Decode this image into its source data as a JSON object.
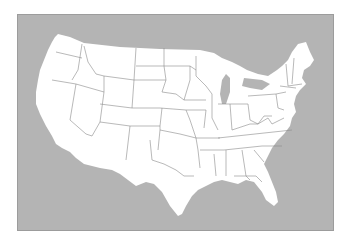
{
  "map": {
    "subject": "Contiguous United States blank outline map",
    "colors": {
      "page": "#ffffff",
      "water": "#b4b4b4",
      "land": "#ffffff",
      "state_border": "#8a8a8a"
    },
    "land_outline": "M55,37 L58,34 L70,37 L84,43 L120,47 L160,49 L200,50 L214,53 L222,58 L232,62 L240,66 L247,70 L258,74 L268,76 L277,70 L282,66 L288,60 L292,52 L298,44 L306,42 L310,52 L314,60 L310,66 L304,70 L302,78 L306,84 L300,90 L296,96 L294,104 L296,112 L292,118 L290,126 L284,134 L278,140 L272,148 L268,156 L264,164 L268,172 L272,182 L276,192 L278,202 L274,206 L266,200 L262,192 L254,182 L246,180 L238,184 L230,182 L222,180 L214,182 L206,186 L198,190 L192,196 L186,206 L182,214 L178,216 L170,206 L162,192 L154,184 L146,182 L136,186 L128,180 L120,174 L112,170 L100,168 L84,164 L76,158 L70,152 L62,148 L56,144 L52,136 L46,126 L40,114 L36,104 L36,92 L38,80 L40,70 L44,60 L48,50 L52,42 Z",
    "lake_michigan": "M222,80 L226,74 L230,78 L230,92 L226,104 L222,104 L220,94 Z",
    "lake_erie_ontario": "M244,78 L262,80 L270,84 L262,90 L250,88 L242,86 Z",
    "state_borders": [
      "M56,52 L82,58",
      "M82,44 L78,70 L72,80",
      "M52,80 L76,84 L104,92",
      "M76,84 L70,120 L86,134 L92,136",
      "M104,92 L100,122 L92,136",
      "M100,104 L132,108",
      "M100,122 L130,126 L126,160",
      "M84,46 L88,62 L96,74 L104,76 L104,92",
      "M104,76 L134,80 L150,80",
      "M136,48 L134,80 L132,108",
      "M136,66 L164,66",
      "M164,48 L164,66 L166,80 L162,92",
      "M132,108 L160,108",
      "M150,80 L166,80",
      "M130,126 L160,126 L162,108",
      "M162,92 L176,94 L184,100",
      "M160,108 L186,110 L190,120",
      "M160,126 L160,130 L180,134 L196,138",
      "M160,130 L158,150",
      "M150,140 L152,160 L164,164 L176,170 L184,176 L194,176",
      "M164,66 L190,66 L196,70",
      "M190,66 L190,80 L184,100",
      "M196,56 L196,76 L206,86",
      "M184,100 L206,100",
      "M186,110 L206,110 L204,128",
      "M190,120 L196,138 L198,150 L200,168",
      "M196,138 L220,138",
      "M206,86 L212,94 L212,118 L218,130",
      "M200,150 L224,150",
      "M214,154 L216,176",
      "M226,150 L226,176",
      "M230,104 L232,130",
      "M218,104 L232,104 L248,104",
      "M232,130 L250,124 L258,124",
      "M248,104 L250,120 L258,124 L264,116 L272,116",
      "M248,96 L276,94 L286,92",
      "M276,94 L278,108 L284,110",
      "M258,124 L268,118 L272,124 L284,118",
      "M218,138 L292,130",
      "M224,150 L262,146 L282,146",
      "M242,150 L246,176 L250,180",
      "M254,150 L264,162",
      "M234,176 L256,176 L262,182",
      "M286,64 L288,86",
      "M294,58 L292,84",
      "M288,86 L302,84",
      "M280,86 L296,88"
    ]
  }
}
